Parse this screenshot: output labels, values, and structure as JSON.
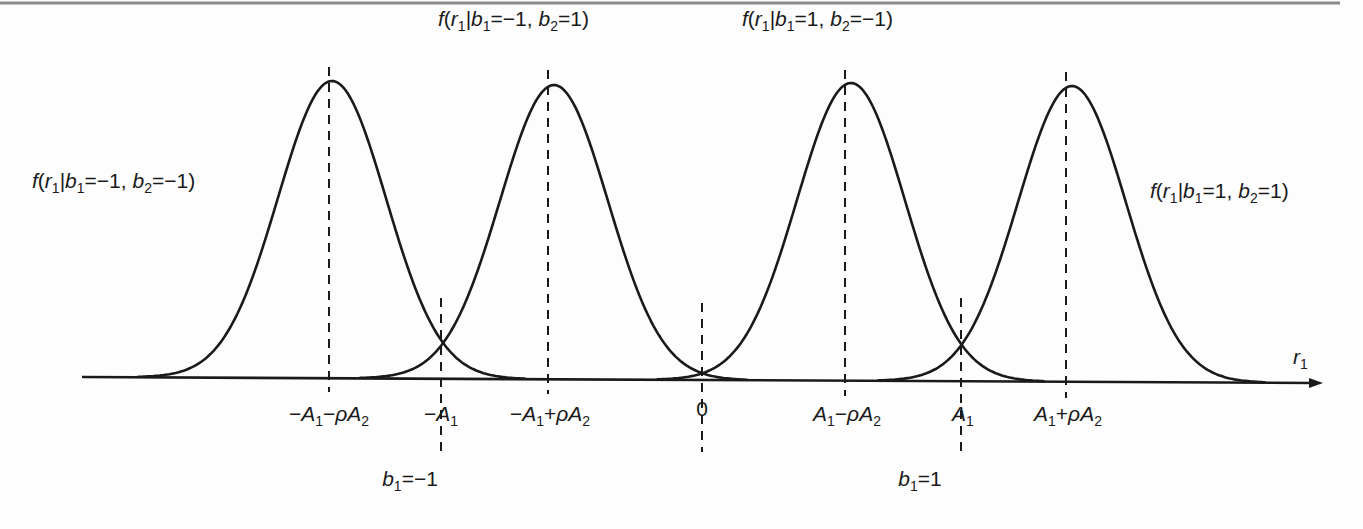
{
  "figure": {
    "top_rule_color": "#8a8a8a",
    "line_color": "#1a1a1a",
    "background": "#fdfdfd",
    "axis": {
      "variable": "r",
      "variable_subscript": "1",
      "x_start": 82,
      "x_end": 1323,
      "y_left": 377,
      "y_right": 383
    },
    "curves": [
      {
        "id": "c1",
        "center_x": 332,
        "peak_y": 81,
        "sigma_px": 54,
        "label": {
          "f": "f",
          "r_sub": "1",
          "b1": "−1",
          "b2": "−1"
        }
      },
      {
        "id": "c2",
        "center_x": 554,
        "peak_y": 85,
        "sigma_px": 54,
        "label": {
          "f": "f",
          "r_sub": "1",
          "b1": "−1",
          "b2": "1"
        }
      },
      {
        "id": "c3",
        "center_x": 851,
        "peak_y": 83,
        "sigma_px": 54,
        "label": {
          "f": "f",
          "r_sub": "1",
          "b1": "1",
          "b2": "−1"
        }
      },
      {
        "id": "c4",
        "center_x": 1072,
        "peak_y": 86,
        "sigma_px": 54,
        "label": {
          "f": "f",
          "r_sub": "1",
          "b1": "1",
          "b2": "1"
        }
      }
    ],
    "ticks": [
      {
        "x": 329,
        "label_parts": [
          "−",
          "A",
          "1",
          "−ρ",
          "A",
          "2"
        ],
        "text": "−A1−ρA2"
      },
      {
        "x": 441,
        "label_parts": [
          "−",
          "A",
          "1"
        ],
        "text": "−A1"
      },
      {
        "x": 548,
        "label_parts": [
          "−",
          "A",
          "1",
          "+ρ",
          "A",
          "2"
        ],
        "text": "−A1+ρA2"
      },
      {
        "x": 702,
        "text": "0"
      },
      {
        "x": 845,
        "label_parts": [
          "",
          "A",
          "1",
          "−ρ",
          "A",
          "2"
        ],
        "text": "A1−ρA2"
      },
      {
        "x": 961,
        "label_parts": [
          "",
          "A",
          "1"
        ],
        "text": "A1"
      },
      {
        "x": 1066,
        "label_parts": [
          "",
          "A",
          "1",
          "+ρ",
          "A",
          "2"
        ],
        "text": "A1+ρA2"
      }
    ],
    "decision_labels": [
      {
        "x": 441,
        "b": "b",
        "sub": "1",
        "value": "=−1"
      },
      {
        "x": 961,
        "b": "b",
        "sub": "1",
        "value": "=1"
      }
    ]
  },
  "chart_data": {
    "type": "line",
    "xlabel": "r1",
    "ylabel": "",
    "x_ticks": [
      "−A1−ρA2",
      "−A1",
      "−A1+ρA2",
      "0",
      "A1−ρA2",
      "A1",
      "A1+ρA2"
    ],
    "series": [
      {
        "name": "f(r1|b1=−1, b2=−1)",
        "mean": "−A1−ρA2",
        "shape": "gaussian"
      },
      {
        "name": "f(r1|b1=−1, b2=1)",
        "mean": "−A1+ρA2",
        "shape": "gaussian"
      },
      {
        "name": "f(r1|b1=1, b2=−1)",
        "mean": "A1−ρA2",
        "shape": "gaussian"
      },
      {
        "name": "f(r1|b1=1, b2=1)",
        "mean": "A1+ρA2",
        "shape": "gaussian"
      }
    ],
    "annotations": [
      "b1=−1 (at −A1)",
      "b1=1 (at A1)",
      "threshold at 0"
    ],
    "grid": false
  }
}
